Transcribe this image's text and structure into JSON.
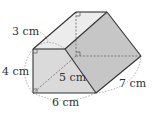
{
  "diagram": {
    "type": "triangular-prism",
    "labels": {
      "top_edge": "3 cm",
      "height": "4 cm",
      "diagonal": "5 cm",
      "bottom": "6 cm",
      "side": "7 cm"
    },
    "colors": {
      "top_face": "#ececec",
      "front_face": "#dadada",
      "slant_face": "#c6c6c6",
      "edge": "#333333",
      "hidden": "#888888"
    }
  }
}
